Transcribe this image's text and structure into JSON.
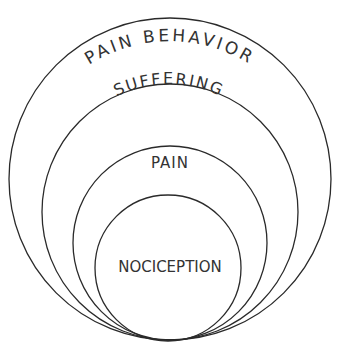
{
  "diagram": {
    "type": "nested-circles",
    "layers": [
      {
        "id": "pain-behavior",
        "label": "PAIN BEHAVIOR",
        "level": 4
      },
      {
        "id": "suffering",
        "label": "SUFFERING",
        "level": 3
      },
      {
        "id": "pain",
        "label": "PAIN",
        "level": 2
      },
      {
        "id": "nociception",
        "label": "NOCICEPTION",
        "level": 1
      }
    ],
    "colors": {
      "stroke": "#2a2a2a",
      "text": "#333333",
      "background": "#ffffff"
    }
  }
}
